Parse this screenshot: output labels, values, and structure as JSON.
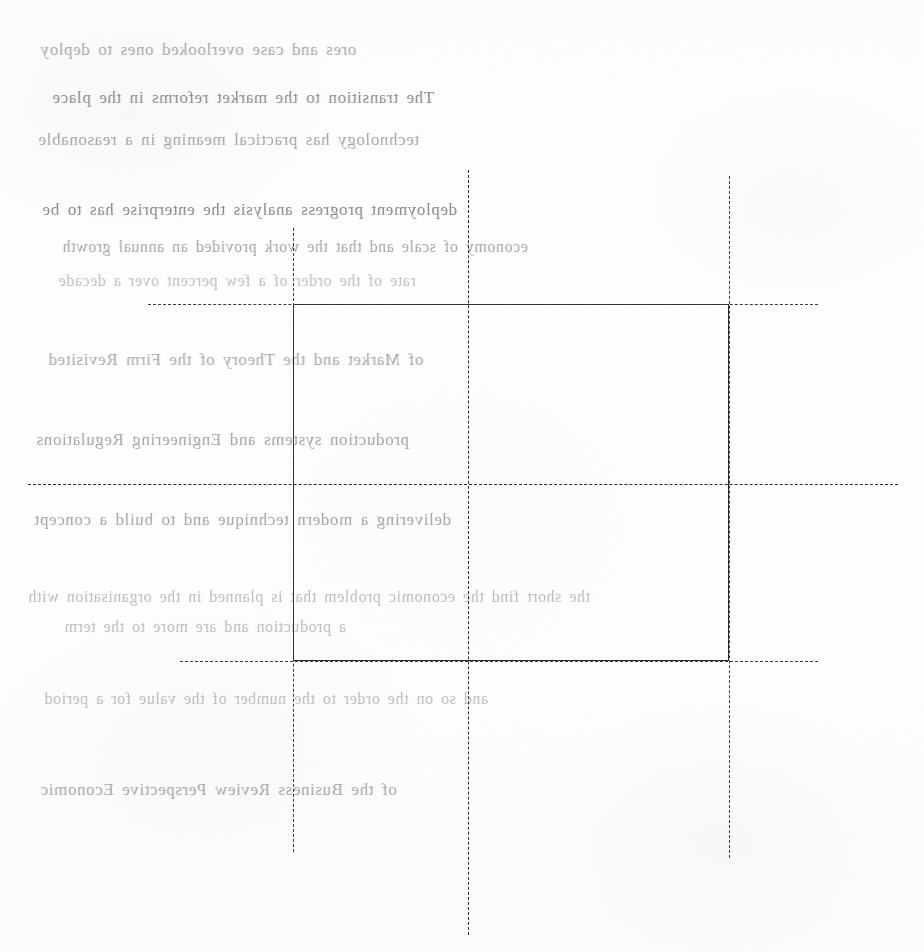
{
  "page": {
    "width": 924,
    "height": 952,
    "background_color": "#fefefe",
    "document_type": "scanned-page-with-registration-marks"
  },
  "ghost_text": {
    "note": "Ink bleed-through from the reverse side of the sheet. Mirrored, very low contrast, not reliably legible.",
    "ink_color": "#6e6e70",
    "opacity": "0.17",
    "lines": [
      {
        "text": "ores and case overlooked ones to deploy",
        "x": 40,
        "y": 40,
        "size": 17,
        "fade": "f2"
      },
      {
        "text": "The transition to the market reforms in the place",
        "x": 52,
        "y": 88,
        "size": 17,
        "fade": "f1"
      },
      {
        "text": "technology has practical meaning in a reasonable",
        "x": 38,
        "y": 130,
        "size": 17,
        "fade": "f2"
      },
      {
        "text": "deployment progress analysis the enterprise has to be",
        "x": 42,
        "y": 200,
        "size": 17,
        "fade": "f1"
      },
      {
        "text": "economy of scale and that the work provided an annual growth",
        "x": 62,
        "y": 238,
        "size": 16,
        "fade": "f2"
      },
      {
        "text": "rate of the order of a few percent over a decade",
        "x": 58,
        "y": 272,
        "size": 16,
        "fade": "f3"
      },
      {
        "text": "of Market and the Theory of the Firm Revisited",
        "x": 48,
        "y": 350,
        "size": 17,
        "fade": "f2"
      },
      {
        "text": "production systems and Engineering Regulations",
        "x": 36,
        "y": 430,
        "size": 17,
        "fade": "f2"
      },
      {
        "text": "delivering a modern technique and to build a concept",
        "x": 34,
        "y": 510,
        "size": 17,
        "fade": "f2"
      },
      {
        "text": "the short find the economic problem that is planned in the organisation with",
        "x": 28,
        "y": 588,
        "size": 16,
        "fade": "f3"
      },
      {
        "text": "a production and are more to the term",
        "x": 64,
        "y": 618,
        "size": 16,
        "fade": "f3"
      },
      {
        "text": "and so on the order to the number of the value for a period",
        "x": 44,
        "y": 690,
        "size": 16,
        "fade": "f3"
      },
      {
        "text": "of the Business Review Perspective Economic",
        "x": 40,
        "y": 780,
        "size": 17,
        "fade": "f2"
      }
    ]
  },
  "registration_marks": {
    "line_color": "#2b2b2b",
    "solid_rect": {
      "name": "trim-box",
      "left": 293,
      "top": 304,
      "right": 729,
      "bottom": 661,
      "width": 436,
      "height": 357,
      "stroke": 1.4
    },
    "center_cross": {
      "name": "center-registration-cross",
      "x": 468,
      "y": 484
    },
    "center_guides": [
      {
        "id": "center-vertical-guide",
        "orientation": "vertical",
        "position": 468,
        "start": 170,
        "end": 935,
        "style": "dashed"
      },
      {
        "id": "center-horizontal-guide",
        "orientation": "horizontal",
        "position": 484,
        "start": 28,
        "end": 898,
        "style": "dashed"
      }
    ],
    "edge_guides": [
      {
        "id": "left-edge-guide",
        "orientation": "vertical",
        "position": 293,
        "start": 228,
        "end": 852,
        "style": "dashed"
      },
      {
        "id": "right-edge-guide",
        "orientation": "vertical",
        "position": 729,
        "start": 176,
        "end": 858,
        "style": "dashed"
      },
      {
        "id": "top-edge-guide",
        "orientation": "horizontal",
        "position": 304,
        "start": 148,
        "end": 818,
        "style": "dashed"
      },
      {
        "id": "bottom-edge-guide",
        "orientation": "horizontal",
        "position": 661,
        "start": 180,
        "end": 818,
        "style": "dashed"
      }
    ]
  }
}
